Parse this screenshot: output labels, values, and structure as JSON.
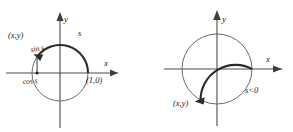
{
  "figure": {
    "panels": [
      {
        "id": "left",
        "description": "Unit circle with positive arc length s measured counterclockwise from (1,0), showing sin s and cos s",
        "axis_x_label": "x",
        "axis_y_label": "y",
        "point_label": "(x,y)",
        "arc_label": "s",
        "vertical_label": "sin s",
        "horizontal_label": "cos s",
        "intercept_label": "(1,0)",
        "arc_direction": "counterclockwise",
        "arc_start_deg": 0,
        "arc_end_deg": 145,
        "point_angle_deg": 145,
        "circle_radius": 28,
        "center": [
          60,
          73
        ]
      },
      {
        "id": "right",
        "description": "Unit circle with negative arc length s measured clockwise from (1,0)",
        "axis_x_label": "x",
        "axis_y_label": "y",
        "point_label": "(x,y)",
        "arc_label": "s<0",
        "arc_direction": "clockwise",
        "arc_start_deg": 0,
        "arc_end_deg": -118,
        "point_angle_deg": -118,
        "circle_radius": 35,
        "center": [
          71,
          69
        ]
      }
    ]
  },
  "colors": {
    "background": "#ffffff",
    "circle_stroke": "#6a6a6a",
    "arc_stroke": "#2b2b2b",
    "axis_stroke": "#4a4a4a",
    "text": "#1a1a1a"
  }
}
